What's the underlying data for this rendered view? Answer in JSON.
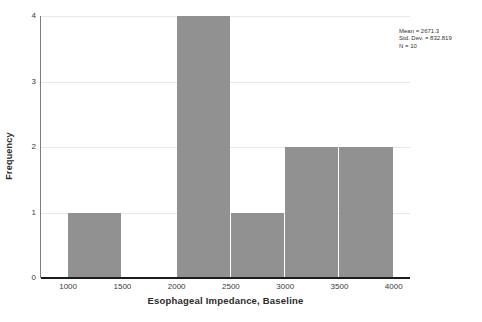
{
  "chart_data": {
    "type": "bar",
    "title": "",
    "subtitle": "",
    "xlabel": "Esophageal Impedance, Baseline",
    "ylabel": "Frequency",
    "grid": true,
    "legend": null,
    "bin_width": 500,
    "xlim": [
      750,
      4150
    ],
    "ylim": [
      0,
      4
    ],
    "x_ticks": [
      "1000",
      "1500",
      "2000",
      "2500",
      "3000",
      "3500",
      "4000"
    ],
    "x_tick_values": [
      1000,
      1500,
      2000,
      2500,
      3000,
      3500,
      4000
    ],
    "y_ticks": [
      "0",
      "1",
      "2",
      "3",
      "4"
    ],
    "y_tick_values": [
      0,
      1,
      2,
      3,
      4
    ],
    "categories": [
      "1000-1500",
      "1500-2000",
      "2000-2500",
      "2500-3000",
      "3000-3500",
      "3500-4000"
    ],
    "values": [
      1,
      0,
      4,
      1,
      2,
      2
    ],
    "bins": [
      {
        "start": 1000,
        "end": 1500,
        "count": 1
      },
      {
        "start": 1500,
        "end": 2000,
        "count": 0
      },
      {
        "start": 2000,
        "end": 2500,
        "count": 4
      },
      {
        "start": 2500,
        "end": 3000,
        "count": 1
      },
      {
        "start": 3000,
        "end": 3500,
        "count": 2
      },
      {
        "start": 3500,
        "end": 4000,
        "count": 2
      }
    ],
    "bar_color": "#919191",
    "gridline_color": "#e8e8e8",
    "axis_color": "#1c1c1c"
  },
  "annotation": {
    "mean_line": "Mean = 2671.3",
    "std_dev_line": "Std. Dev. = 832.819",
    "n_line": "N = 10"
  }
}
